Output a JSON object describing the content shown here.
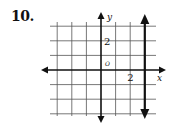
{
  "problem": {
    "number": "10."
  },
  "chart_data": {
    "type": "line",
    "title": "",
    "xlabel": "x",
    "ylabel": "y",
    "origin_label": "O",
    "xlim": [
      -3,
      3
    ],
    "ylim": [
      -3,
      3
    ],
    "grid": true,
    "grid_step": 1,
    "x_tick_labels": [
      {
        "value": 2,
        "label": "2"
      }
    ],
    "y_tick_labels": [
      {
        "value": 2,
        "label": "2"
      }
    ],
    "series": [
      {
        "name": "x = 3",
        "kind": "vertical-line",
        "x": 3,
        "arrows": "both"
      }
    ],
    "colors": {
      "grid": "#555555",
      "axes": "#111111",
      "line": "#111111"
    }
  }
}
